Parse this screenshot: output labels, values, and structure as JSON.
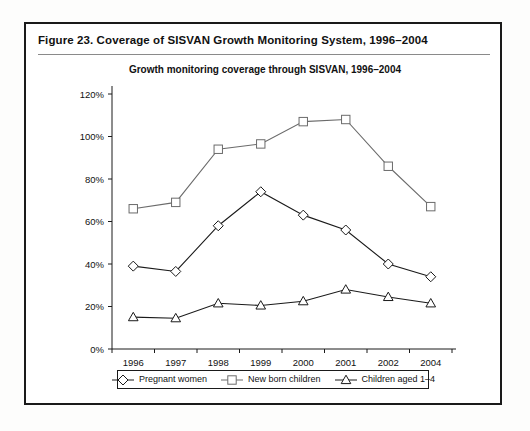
{
  "figure": {
    "caption": "Figure 23.  Coverage of SISVAN Growth Monitoring System, 1996–2004"
  },
  "chart_data": {
    "type": "line",
    "title": "Growth monitoring coverage through SISVAN, 1996–2004",
    "xlabel": "",
    "ylabel": "",
    "categories": [
      "1996",
      "1997",
      "1998",
      "1999",
      "2000",
      "2001",
      "2002",
      "2004"
    ],
    "ylim": [
      0,
      120
    ],
    "ytick_values": [
      0,
      20,
      40,
      60,
      80,
      100,
      120
    ],
    "ytick_labels": [
      "0%",
      "20%",
      "40%",
      "60%",
      "80%",
      "100%",
      "120%"
    ],
    "grid": false,
    "legend_position": "bottom",
    "series": [
      {
        "name": "Pregnant women",
        "marker": "diamond",
        "color": "#1a1a1a",
        "values": [
          39,
          36.5,
          58,
          74,
          63,
          56,
          40,
          34
        ]
      },
      {
        "name": "New born children",
        "marker": "square",
        "color": "#6b6b6b",
        "values": [
          66,
          69,
          94,
          96.5,
          107,
          108,
          86,
          67
        ]
      },
      {
        "name": "Children aged 1–4",
        "marker": "triangle",
        "color": "#1a1a1a",
        "values": [
          15,
          14.5,
          21.5,
          20.5,
          22.5,
          28,
          24.5,
          21.5
        ]
      }
    ]
  }
}
